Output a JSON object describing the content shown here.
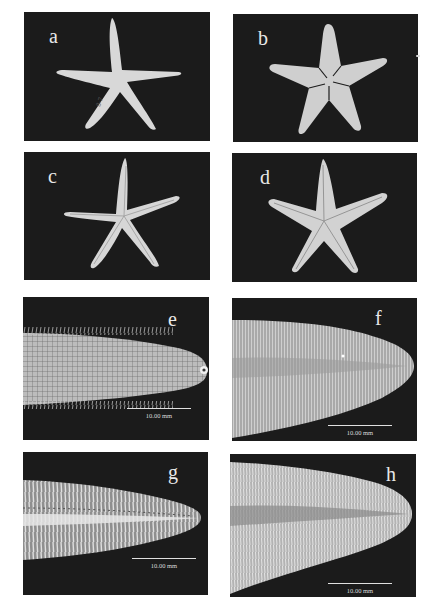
{
  "figure": {
    "panels": [
      {
        "id": "a",
        "label": "a",
        "content": "starfish whole specimen, slender arms, aboral view",
        "tag_text": "8-7"
      },
      {
        "id": "b",
        "label": "b",
        "content": "starfish whole specimen, broad arms, aboral view"
      },
      {
        "id": "c",
        "label": "c",
        "content": "starfish whole specimen, slender arms, oral view"
      },
      {
        "id": "d",
        "label": "d",
        "content": "starfish whole specimen, broad arms, oral view"
      },
      {
        "id": "e",
        "label": "e",
        "content": "arm tip close-up, aboral plates",
        "scale_bar": "10.00 mm"
      },
      {
        "id": "f",
        "label": "f",
        "content": "arm tip close-up, aboral surface",
        "scale_bar": "10.00 mm"
      },
      {
        "id": "g",
        "label": "g",
        "content": "arm tip close-up, oral ambulacral groove",
        "scale_bar": "10.00 mm"
      },
      {
        "id": "h",
        "label": "h",
        "content": "arm tip close-up, oral ambulacral groove",
        "scale_bar": "10.00 mm"
      }
    ]
  },
  "colors": {
    "background": "#ffffff",
    "panel_bg": "#1b1b1b",
    "specimen": "#d9d9d9",
    "label": "#e8e8e8"
  }
}
